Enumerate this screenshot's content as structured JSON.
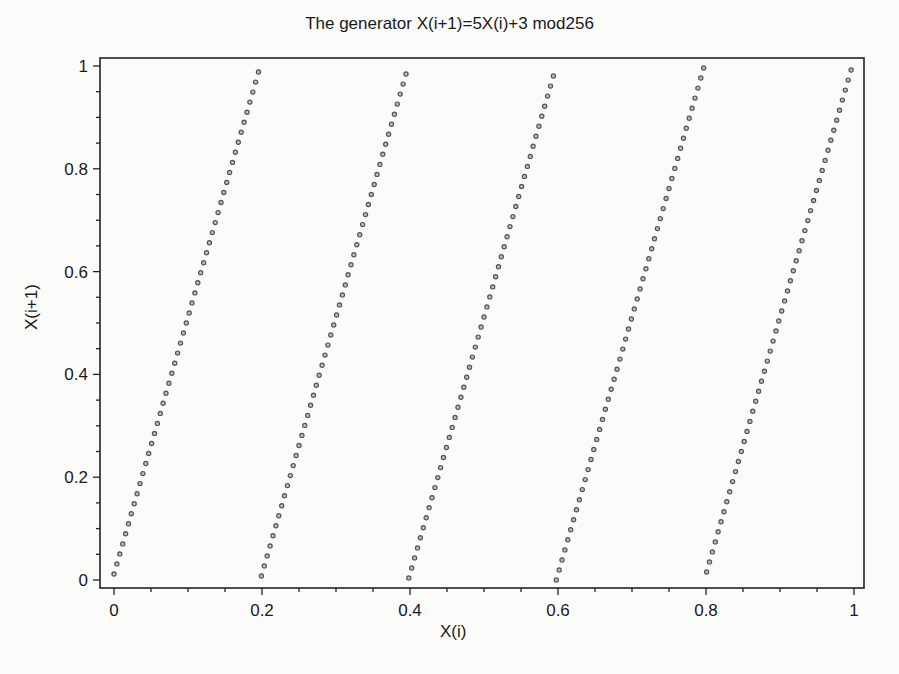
{
  "chart_data": {
    "type": "scatter",
    "title": "The generator X(i+1)=5X(i)+3 mod256",
    "xlabel": "X(i)",
    "ylabel": "X(i+1)",
    "xlim": [
      0,
      1
    ],
    "ylim": [
      0,
      1
    ],
    "x_ticks": [
      "0",
      "0.2",
      "0.4",
      "0.6",
      "0.8",
      "1"
    ],
    "y_ticks": [
      "0",
      "0.2",
      "0.4",
      "0.6",
      "0.8",
      "1"
    ],
    "grid": false,
    "legend": null,
    "generator": {
      "multiplier": 5,
      "increment": 3,
      "modulus": 256
    },
    "series": [
      {
        "name": "X(i+1) vs X(i)",
        "marker": "open-circle",
        "description": "256 points: x = n/256, y = ((5n+3) mod 256)/256 for n = 0..255, forming 5 parallel diagonal segments",
        "segments": [
          {
            "x_range": [
              0.0,
              0.195
            ],
            "y_range": [
              0.012,
              0.988
            ]
          },
          {
            "x_range": [
              0.199,
              0.395
            ],
            "y_range": [
              0.008,
              0.984
            ]
          },
          {
            "x_range": [
              0.398,
              0.594
            ],
            "y_range": [
              0.004,
              0.98
            ]
          },
          {
            "x_range": [
              0.598,
              0.793
            ],
            "y_range": [
              0.0,
              0.977
            ]
          },
          {
            "x_range": [
              0.797,
              0.996
            ],
            "y_range": [
              0.016,
              0.996
            ]
          }
        ]
      }
    ]
  },
  "colors": {
    "background": "#fbfbfa",
    "axis": "#222222",
    "marker": "#555555"
  }
}
